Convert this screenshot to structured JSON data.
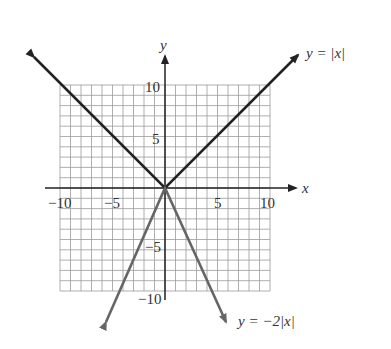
{
  "chart_data": {
    "type": "line",
    "title": "",
    "xlabel": "x",
    "ylabel": "y",
    "xlim": [
      -10,
      10
    ],
    "ylim": [
      -10,
      10
    ],
    "grid": true,
    "x_ticks": [
      "-10",
      "-5",
      "5",
      "10"
    ],
    "y_ticks": [
      "10",
      "5",
      "-5",
      "-10"
    ],
    "series": [
      {
        "name": "y = |x|",
        "label": "y = |x|",
        "color": "#222222",
        "x": [
          -12.5,
          0,
          12.5
        ],
        "y": [
          12.5,
          0,
          12.5
        ]
      },
      {
        "name": "y = -2|x|",
        "label": "y = −2|x|",
        "color": "#666666",
        "x": [
          -5.8,
          0,
          5.8
        ],
        "y": [
          -11.6,
          0,
          -11.6
        ]
      }
    ]
  },
  "labels": {
    "x_axis": "x",
    "y_axis": "y",
    "curve1": "y = |x|",
    "curve2": "y = −2|x|",
    "tick_x_neg10": "−10",
    "tick_x_neg5": "−5",
    "tick_x_5": "5",
    "tick_x_10": "10",
    "tick_y_10": "10",
    "tick_y_5": "5",
    "tick_y_neg5": "−5",
    "tick_y_neg10": "−10"
  }
}
